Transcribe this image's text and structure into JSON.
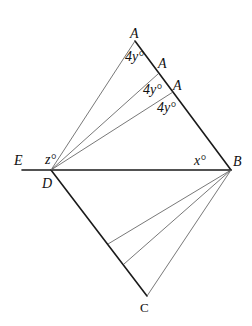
{
  "diagram": {
    "type": "geometry",
    "points": {
      "A1": {
        "label": "A",
        "x": 135,
        "y": 41
      },
      "A2": {
        "label": "A",
        "x": 158,
        "y": 74
      },
      "A3": {
        "label": "A",
        "x": 173,
        "y": 92
      },
      "B": {
        "label": "B",
        "x": 231,
        "y": 170
      },
      "C": {
        "label": "C",
        "x": 147,
        "y": 296
      },
      "D": {
        "label": "D",
        "x": 51,
        "y": 170
      },
      "E": {
        "label": "E",
        "x": 22,
        "y": 170
      },
      "P1": {
        "label": "",
        "x": 108,
        "y": 244
      },
      "P2": {
        "label": "",
        "x": 124,
        "y": 264
      }
    },
    "angle_labels": {
      "a1": "4y°",
      "a2": "4y°",
      "a3": "4y°",
      "x": "x°",
      "z": "z°"
    },
    "colors": {
      "solid": "#1a1a1a",
      "thin": "#555555"
    }
  }
}
